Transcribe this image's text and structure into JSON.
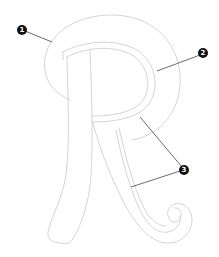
{
  "diagram": {
    "callouts": [
      {
        "number": "1",
        "x": 22,
        "y": 30,
        "target": [
          52,
          42
        ]
      },
      {
        "number": "2",
        "x": 203,
        "y": 53,
        "target": [
          157,
          71
        ]
      },
      {
        "number": "3",
        "x": 184,
        "y": 170,
        "targets": [
          [
            140,
            117
          ],
          [
            131,
            187
          ]
        ]
      }
    ],
    "colors": {
      "outline": "#cfcfcf",
      "leader": "#444444",
      "badge": "#111111",
      "background": "#ffffff"
    }
  }
}
